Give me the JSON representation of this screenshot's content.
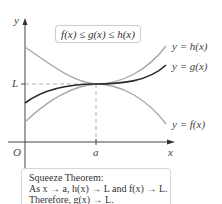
{
  "diagram": {
    "axes": {
      "x_label": "x",
      "y_label": "y",
      "origin_label": "O",
      "x_tick_label": "a",
      "y_tick_label": "L"
    },
    "inequality": "f(x) ≤ g(x) ≤ h(x)",
    "curves": [
      {
        "name": "h",
        "label": "y = h(x)",
        "color": "#a8a8a8"
      },
      {
        "name": "g",
        "label": "y = g(x)",
        "color": "#2a2a2a"
      },
      {
        "name": "f",
        "label": "y = f(x)",
        "color": "#a8a8a8"
      }
    ],
    "theorem": {
      "line1": "Squeeze Theorem:",
      "line2": "As x → a, h(x) → L and  f(x) → L.",
      "line3": "Therefore, g(x) → L."
    }
  }
}
